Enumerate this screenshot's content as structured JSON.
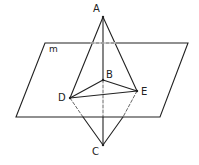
{
  "diagram": {
    "title": "",
    "plane_label": "m",
    "points": {
      "A": {
        "label": "A",
        "x": 103,
        "y": 17
      },
      "B": {
        "label": "B",
        "x": 103,
        "y": 80
      },
      "C": {
        "label": "C",
        "x": 103,
        "y": 145
      },
      "D": {
        "label": "D",
        "x": 70,
        "y": 98
      },
      "E": {
        "label": "E",
        "x": 137,
        "y": 91
      }
    },
    "stroke_color": "#222222"
  }
}
